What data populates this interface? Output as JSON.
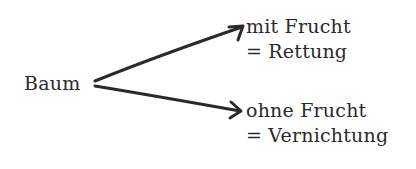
{
  "diagram": {
    "root": {
      "label": "Baum"
    },
    "branches": [
      {
        "condition": "mit Frucht",
        "outcome": "= Rettung"
      },
      {
        "condition": "ohne Frucht",
        "outcome": "= Vernichtung"
      }
    ],
    "colors": {
      "ink": "#2a2a2a",
      "background": "#ffffff"
    }
  }
}
